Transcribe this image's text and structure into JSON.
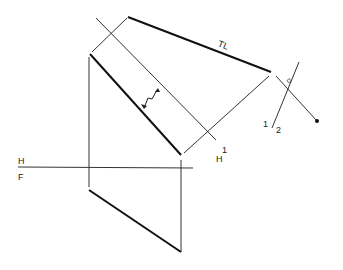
{
  "diagram": {
    "type": "descriptive-geometry-auxiliary-view",
    "colors": {
      "background": "#ffffff",
      "line": "#1a1a1a",
      "thin_line": "#333333"
    },
    "labels": {
      "true_length": "TL",
      "fold_hf_top": "H",
      "fold_hf_bottom": "F",
      "fold_h1_top": "H",
      "fold_h1_bottom": "1",
      "fold_12_left": "1",
      "fold_12_right": "2"
    }
  }
}
